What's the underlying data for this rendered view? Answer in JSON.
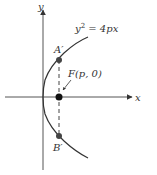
{
  "diagram": {
    "axis_x_label": "x",
    "axis_y_label": "y",
    "equation_base": "y",
    "equation_exp": "2",
    "equation_rest": " = 4px",
    "focus_label": "F(p, 0)",
    "point_a_label": "A′",
    "point_b_label": "B′",
    "colors": {
      "axis": "#555555",
      "curve": "#333333",
      "point": "#333333",
      "dashed": "#444444"
    }
  }
}
